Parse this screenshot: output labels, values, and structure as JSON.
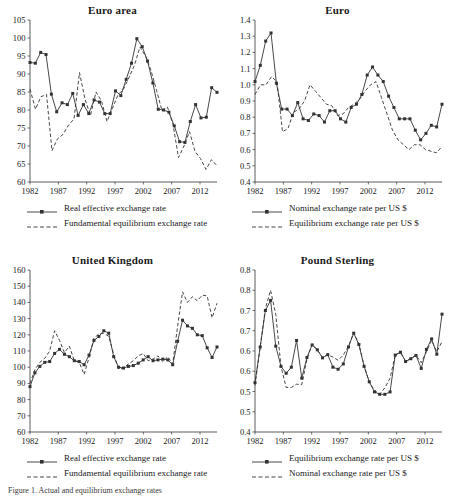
{
  "figure": {
    "caption": "Figure 1. Actual and equilibrium exchange rates"
  },
  "legend_styles": {
    "solid_label": "solid-line-with-square-markers",
    "dashed_label": "dashed-line"
  },
  "chart_data": [
    {
      "id": "euro-area",
      "type": "line",
      "title": "Euro area",
      "xlabel": "",
      "ylabel": "",
      "grid": false,
      "legend_position": "below",
      "xlim": [
        1982,
        2015
      ],
      "ylim": [
        60,
        105
      ],
      "yticks": [
        105,
        100,
        95,
        90,
        85,
        80,
        75,
        70,
        65,
        60
      ],
      "xticks": [
        1982,
        1987,
        1992,
        1997,
        2002,
        2007,
        2012
      ],
      "x": [
        1982,
        1983,
        1984,
        1985,
        1986,
        1987,
        1988,
        1989,
        1990,
        1991,
        1992,
        1993,
        1994,
        1995,
        1996,
        1997,
        1998,
        1999,
        2000,
        2001,
        2002,
        2003,
        2004,
        2005,
        2006,
        2007,
        2008,
        2009,
        2010,
        2011,
        2012,
        2013,
        2014,
        2015
      ],
      "series": [
        {
          "name": "Real effective exchange rate",
          "style": "solid-markers",
          "values": [
            93.2,
            93.0,
            96.0,
            95.4,
            84.4,
            79.5,
            82.0,
            81.5,
            84.6,
            78.5,
            81.5,
            79.0,
            82.8,
            82.2,
            79.0,
            79.0,
            85.3,
            84.0,
            88.5,
            93.0,
            99.8,
            97.6,
            93.6,
            87.5,
            80.2,
            80.0,
            79.4,
            75.6,
            71.2,
            71.0,
            76.8,
            81.5,
            77.8,
            78.0
          ]
        },
        {
          "name": "Fundamental equilibrium exchange rate",
          "style": "dashed",
          "values": [
            85.8,
            80.2,
            83.7,
            84.3,
            68.7,
            72.0,
            73.2,
            75.8,
            77.5,
            90.4,
            83.0,
            78.5,
            85.0,
            82.5,
            76.8,
            80.5,
            84.2,
            85.8,
            89.0,
            92.5,
            97.5,
            95.0,
            91.0,
            85.5,
            79.8,
            80.8,
            76.0,
            66.8,
            70.0,
            74.0,
            68.5,
            66.5,
            63.5,
            66.2
          ]
        }
      ],
      "extra_points": {
        "solid_tail": [
          86.2,
          84.9
        ],
        "dashed_tail": [
          64.5
        ]
      }
    },
    {
      "id": "euro",
      "type": "line",
      "title": "Euro",
      "xlabel": "",
      "ylabel": "",
      "grid": false,
      "legend_position": "below",
      "xlim": [
        1982,
        2015
      ],
      "ylim": [
        0.4,
        1.4
      ],
      "yticks": [
        "1.4",
        "1.3",
        "1.2",
        "1.1",
        "1.0",
        "0.9",
        "0.8",
        "0.7",
        "0.6",
        "0.5",
        "0.4"
      ],
      "xticks": [
        1982,
        1987,
        1992,
        1997,
        2002,
        2007,
        2012
      ],
      "x": [
        1982,
        1983,
        1984,
        1985,
        1986,
        1987,
        1988,
        1989,
        1990,
        1991,
        1992,
        1993,
        1994,
        1995,
        1996,
        1997,
        1998,
        1999,
        2000,
        2001,
        2002,
        2003,
        2004,
        2005,
        2006,
        2007,
        2008,
        2009,
        2010,
        2011,
        2012,
        2013,
        2014,
        2015
      ],
      "series": [
        {
          "name": "Nominal exchange rate per US $",
          "style": "solid-markers",
          "values": [
            1.02,
            1.12,
            1.27,
            1.32,
            1.01,
            0.85,
            0.85,
            0.81,
            0.89,
            0.79,
            0.78,
            0.82,
            0.81,
            0.77,
            0.84,
            0.84,
            0.79,
            0.77,
            0.86,
            0.88,
            0.94,
            1.06,
            1.11,
            1.06,
            1.02,
            0.93,
            0.86,
            0.79,
            0.79,
            0.79,
            0.72,
            0.66,
            0.7,
            0.75
          ]
        },
        {
          "name": "Equilibrium exchange rate per US $",
          "style": "dashed",
          "values": [
            0.94,
            1.0,
            1.0,
            1.05,
            1.02,
            0.71,
            0.73,
            0.83,
            0.85,
            0.9,
            1.0,
            0.96,
            0.92,
            0.88,
            0.87,
            0.81,
            0.82,
            0.86,
            0.88,
            0.91,
            0.96,
            1.0,
            1.02,
            0.92,
            0.82,
            0.72,
            0.66,
            0.63,
            0.6,
            0.63,
            0.63,
            0.6,
            0.59,
            0.58
          ]
        }
      ],
      "extra_points": {
        "solid_tail": [
          0.74,
          0.88
        ],
        "dashed_tail": [
          0.62
        ]
      }
    },
    {
      "id": "united-kingdom",
      "type": "line",
      "title": "United Kingdom",
      "xlabel": "",
      "ylabel": "",
      "grid": false,
      "legend_position": "below",
      "xlim": [
        1982,
        2015
      ],
      "ylim": [
        60,
        160
      ],
      "yticks": [
        160,
        150,
        140,
        130,
        120,
        110,
        100,
        90,
        80,
        70,
        60
      ],
      "xticks": [
        1982,
        1987,
        1992,
        1997,
        2002,
        2007,
        2012
      ],
      "x": [
        1982,
        1983,
        1984,
        1985,
        1986,
        1987,
        1988,
        1989,
        1990,
        1991,
        1992,
        1993,
        1994,
        1995,
        1996,
        1997,
        1998,
        1999,
        2000,
        2001,
        2002,
        2003,
        2004,
        2005,
        2006,
        2007,
        2008,
        2009,
        2010,
        2011,
        2012,
        2013,
        2014,
        2015
      ],
      "series": [
        {
          "name": "Real effective exchange rate",
          "style": "solid-markers",
          "values": [
            88.0,
            96.5,
            100.5,
            103.0,
            103.5,
            108.5,
            111.0,
            108.0,
            106.5,
            104.0,
            103.5,
            101.5,
            107.5,
            116.5,
            119.0,
            122.5,
            121.0,
            106.5,
            100.0,
            99.5,
            100.5,
            101.0,
            102.5,
            104.5,
            106.5,
            104.0,
            104.5,
            105.0,
            104.5,
            101.5,
            116.0,
            129.0,
            125.5,
            124.0
          ]
        },
        {
          "name": "Fundamental equilibrium exchange rate",
          "style": "dashed",
          "values": [
            90.0,
            98.5,
            103.0,
            105.5,
            110.0,
            122.5,
            116.5,
            109.0,
            113.0,
            104.0,
            103.0,
            95.5,
            106.0,
            118.0,
            120.5,
            121.0,
            119.0,
            108.0,
            99.0,
            99.5,
            102.0,
            104.0,
            107.0,
            108.5,
            104.0,
            105.0,
            107.0,
            103.5,
            106.5,
            102.0,
            125.5,
            146.5,
            140.0,
            143.5
          ]
        }
      ],
      "extra_points": {
        "solid_tail": [
          120.0,
          119.5,
          112.0,
          106.0,
          112.5
        ],
        "dashed_tail": [
          141.0,
          144.5,
          144.0,
          130.5,
          139.5
        ]
      }
    },
    {
      "id": "pound-sterling",
      "type": "line",
      "title": "Pound Sterling",
      "xlabel": "",
      "ylabel": "",
      "grid": false,
      "legend_position": "below",
      "xlim": [
        1982,
        2015
      ],
      "ylim": [
        0.45,
        0.85
      ],
      "yticks": [
        "0.8",
        "0.8",
        "0.7",
        "0.7",
        "0.6",
        "0.6",
        "0.5",
        "0.5",
        "0.4"
      ],
      "ytick_values": [
        0.85,
        0.8,
        0.75,
        0.7,
        0.65,
        0.6,
        0.55,
        0.5,
        0.45
      ],
      "xticks": [
        1982,
        1987,
        1992,
        1997,
        2002,
        2007,
        2012
      ],
      "x": [
        1982,
        1983,
        1984,
        1985,
        1986,
        1987,
        1988,
        1989,
        1990,
        1991,
        1992,
        1993,
        1994,
        1995,
        1996,
        1997,
        1998,
        1999,
        2000,
        2001,
        2002,
        2003,
        2004,
        2005,
        2006,
        2007,
        2008,
        2009,
        2010,
        2011,
        2012,
        2013,
        2014,
        2015
      ],
      "series": [
        {
          "name": "Equilibrium exchange rate per US $",
          "style": "solid-markers",
          "values": [
            0.572,
            0.66,
            0.75,
            0.775,
            0.662,
            0.612,
            0.595,
            0.61,
            0.676,
            0.583,
            0.634,
            0.665,
            0.653,
            0.633,
            0.641,
            0.61,
            0.605,
            0.618,
            0.66,
            0.694,
            0.666,
            0.612,
            0.574,
            0.549,
            0.543,
            0.543,
            0.549,
            0.64,
            0.647,
            0.624,
            0.631,
            0.639,
            0.607,
            0.654
          ]
        },
        {
          "name": "Nominal exchange rate per US $",
          "style": "dashed",
          "values": [
            0.565,
            0.66,
            0.755,
            0.8,
            0.74,
            0.612,
            0.56,
            0.56,
            0.568,
            0.567,
            0.63,
            0.667,
            0.652,
            0.634,
            0.641,
            0.635,
            0.627,
            0.64,
            0.662,
            0.695,
            0.667,
            0.614,
            0.573,
            0.553,
            0.543,
            0.559,
            0.583,
            0.64,
            0.647,
            0.625,
            0.631,
            0.64,
            0.621,
            0.648
          ]
        }
      ],
      "extra_points": {
        "solid_tail": [
          0.68,
          0.642,
          0.741
        ],
        "dashed_tail": [
          0.676,
          0.648,
          0.673
        ]
      }
    }
  ],
  "panels": [
    {
      "id": "euro-area",
      "title": "Euro area",
      "legend": [
        {
          "label": "Real effective exchange rate",
          "style": "solid-markers"
        },
        {
          "label": "Fundamental equilibrium exchange rate",
          "style": "dashed"
        }
      ]
    },
    {
      "id": "euro",
      "title": "Euro",
      "legend": [
        {
          "label": "Nominal exchange rate per US $",
          "style": "solid-markers"
        },
        {
          "label": "Equilibrium exchange rate per US $",
          "style": "dashed"
        }
      ]
    },
    {
      "id": "united-kingdom",
      "title": "United Kingdom",
      "legend": [
        {
          "label": "Real effective exchange rate",
          "style": "solid-markers"
        },
        {
          "label": "Fundamental equilibrium exchange rate",
          "style": "dashed"
        }
      ]
    },
    {
      "id": "pound-sterling",
      "title": "Pound Sterling",
      "legend": [
        {
          "label": "Equilibrium exchange rate per US $",
          "style": "solid-markers"
        },
        {
          "label": "Nominal exchange rate per US $",
          "style": "dashed"
        }
      ]
    }
  ]
}
